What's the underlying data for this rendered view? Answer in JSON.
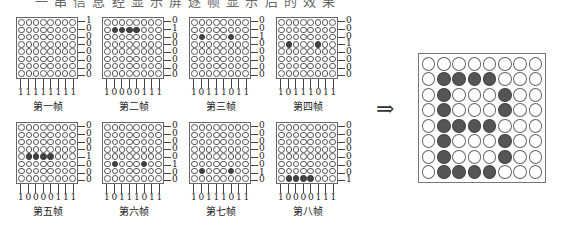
{
  "caption_top": "一 串 信 息 经 显 示 屏 逐 帧 显 示 后 的 效 果",
  "arrow": "⇒",
  "frames": [
    {
      "label": "第一帧",
      "rows": [
        "1",
        "0",
        "0",
        "0",
        "0",
        "0",
        "0",
        "0"
      ],
      "cols": [
        "1",
        "1",
        "1",
        "1",
        "1",
        "1",
        "1",
        "1"
      ],
      "on": []
    },
    {
      "label": "第二帧",
      "rows": [
        "0",
        "1",
        "0",
        "0",
        "0",
        "0",
        "0",
        "0"
      ],
      "cols": [
        "1",
        "0",
        "0",
        "0",
        "0",
        "1",
        "1",
        "1"
      ],
      "on": [
        [
          1,
          1
        ],
        [
          1,
          2
        ],
        [
          1,
          3
        ],
        [
          1,
          4
        ]
      ]
    },
    {
      "label": "第三帧",
      "rows": [
        "0",
        "0",
        "1",
        "0",
        "0",
        "0",
        "0",
        "0"
      ],
      "cols": [
        "1",
        "0",
        "1",
        "1",
        "1",
        "0",
        "1",
        "1"
      ],
      "on": [
        [
          2,
          1
        ],
        [
          2,
          5
        ]
      ]
    },
    {
      "label": "第四帧",
      "rows": [
        "0",
        "0",
        "0",
        "1",
        "0",
        "0",
        "0",
        "0"
      ],
      "cols": [
        "1",
        "0",
        "1",
        "1",
        "1",
        "0",
        "1",
        "1"
      ],
      "on": [
        [
          3,
          1
        ],
        [
          3,
          5
        ]
      ]
    },
    {
      "label": "第五帧",
      "rows": [
        "0",
        "0",
        "0",
        "0",
        "1",
        "0",
        "0",
        "0"
      ],
      "cols": [
        "1",
        "0",
        "0",
        "0",
        "0",
        "1",
        "1",
        "1"
      ],
      "on": [
        [
          4,
          1
        ],
        [
          4,
          2
        ],
        [
          4,
          3
        ],
        [
          4,
          4
        ]
      ]
    },
    {
      "label": "第六帧",
      "rows": [
        "0",
        "0",
        "0",
        "0",
        "0",
        "1",
        "0",
        "0"
      ],
      "cols": [
        "1",
        "0",
        "1",
        "1",
        "1",
        "0",
        "1",
        "1"
      ],
      "on": [
        [
          5,
          1
        ],
        [
          5,
          5
        ]
      ]
    },
    {
      "label": "第七帧",
      "rows": [
        "0",
        "0",
        "0",
        "0",
        "0",
        "0",
        "1",
        "0"
      ],
      "cols": [
        "1",
        "0",
        "1",
        "1",
        "1",
        "0",
        "1",
        "1"
      ],
      "on": [
        [
          6,
          1
        ],
        [
          6,
          5
        ]
      ]
    },
    {
      "label": "第八帧",
      "rows": [
        "0",
        "0",
        "0",
        "0",
        "0",
        "0",
        "0",
        "1"
      ],
      "cols": [
        "1",
        "0",
        "0",
        "0",
        "0",
        "1",
        "1",
        "1"
      ],
      "on": [
        [
          7,
          1
        ],
        [
          7,
          2
        ],
        [
          7,
          3
        ],
        [
          7,
          4
        ]
      ]
    }
  ],
  "result": {
    "on": [
      [
        1,
        1
      ],
      [
        1,
        2
      ],
      [
        1,
        3
      ],
      [
        1,
        4
      ],
      [
        2,
        1
      ],
      [
        2,
        5
      ],
      [
        3,
        1
      ],
      [
        3,
        5
      ],
      [
        4,
        1
      ],
      [
        4,
        2
      ],
      [
        4,
        3
      ],
      [
        4,
        4
      ],
      [
        5,
        1
      ],
      [
        5,
        5
      ],
      [
        6,
        1
      ],
      [
        6,
        5
      ],
      [
        7,
        1
      ],
      [
        7,
        2
      ],
      [
        7,
        3
      ],
      [
        7,
        4
      ]
    ]
  },
  "colors": {
    "dot_on": "#444444",
    "dot_off": "#ffffff",
    "border": "#666666"
  }
}
